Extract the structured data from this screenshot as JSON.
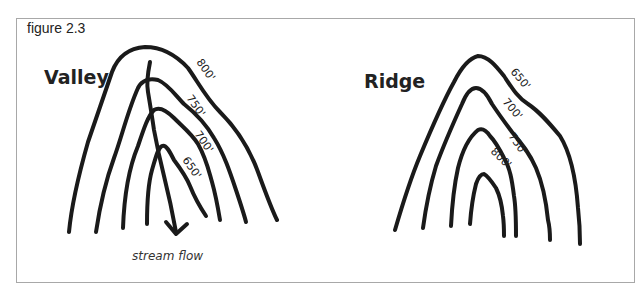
{
  "figure": {
    "label": "figure 2.3"
  },
  "valley": {
    "title": "Valley",
    "contours": [
      "800'",
      "750'",
      "700'",
      "650'"
    ],
    "stream_label": "stream flow"
  },
  "ridge": {
    "title": "Ridge",
    "contours": [
      "650'",
      "700'",
      "750'",
      "800'"
    ]
  },
  "colors": {
    "line": "#1a1a1a",
    "border": "#a8a8a8",
    "background": "#ffffff"
  }
}
